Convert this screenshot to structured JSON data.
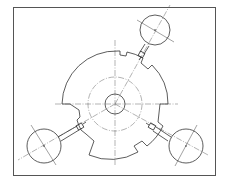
{
  "figure": {
    "frame": {
      "x": 13,
      "y": 7,
      "width": 202,
      "height": 168,
      "color": "#555555"
    },
    "disc": {
      "cx": 115,
      "cy": 105,
      "r_outer": 55,
      "r_pitch": 27,
      "r_bore": 10
    },
    "gauges": [
      {
        "name": "top-right",
        "angle_deg": -60,
        "cx": 155,
        "cy": 30,
        "r": 15
      },
      {
        "name": "bottom-left",
        "angle_deg": 200,
        "cx": 44,
        "cy": 146,
        "r": 17
      },
      {
        "name": "bottom-right",
        "angle_deg": 30,
        "cx": 186,
        "cy": 146,
        "r": 17
      }
    ],
    "line_color": "#333333"
  }
}
